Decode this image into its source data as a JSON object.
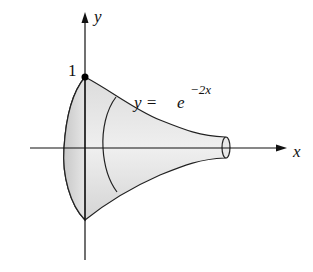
{
  "diagram": {
    "type": "surface-of-revolution",
    "axes": {
      "x_label": "x",
      "y_label": "y"
    },
    "point_label": "1",
    "equation": {
      "lhs": "y = ",
      "base": "e",
      "exponent": "−2x"
    },
    "colors": {
      "fill": "#d6d6d6",
      "stroke": "#222222",
      "background": "#ffffff"
    }
  }
}
